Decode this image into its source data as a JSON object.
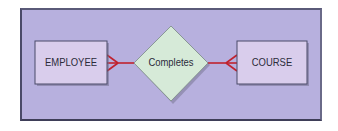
{
  "diagram": {
    "type": "entity-relationship",
    "entities": [
      {
        "id": "employee",
        "label": "EMPLOYEE"
      },
      {
        "id": "course",
        "label": "COURSE"
      }
    ],
    "relationships": [
      {
        "id": "completes",
        "label": "Completes",
        "from": "employee",
        "to": "course",
        "from_cardinality": "many",
        "to_cardinality": "many"
      }
    ],
    "colors": {
      "background": "#b7b0de",
      "entity_fill": "#d9cdec",
      "relationship_fill": "#d6ead8",
      "connector": "#c0222e",
      "border": "#4a4a68"
    }
  }
}
